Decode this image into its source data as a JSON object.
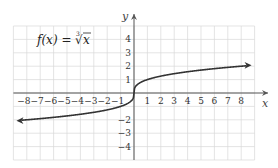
{
  "chart_data": {
    "type": "line",
    "title_parts": {
      "lhs": "f(x)",
      "eq": "=",
      "index": "3",
      "radicand": "x"
    },
    "xlabel": "x",
    "ylabel": "y",
    "xlim": [
      -9,
      9
    ],
    "ylim": [
      -5,
      5
    ],
    "x_ticks": [
      -8,
      -7,
      -6,
      -5,
      -4,
      -3,
      -2,
      -1,
      1,
      2,
      3,
      4,
      5,
      6,
      7,
      8
    ],
    "y_ticks": [
      -4,
      -3,
      -2,
      1,
      2,
      3,
      4
    ],
    "grid": true,
    "legend": null,
    "series": [
      {
        "name": "f(x) = ∛x",
        "function": "cbrt",
        "x": [
          -8.5,
          -8,
          -6,
          -4,
          -2,
          -1,
          -0.5,
          -0.125,
          0,
          0.125,
          0.5,
          1,
          2,
          4,
          6,
          8,
          8.5
        ],
        "y": [
          -2.04,
          -2,
          -1.82,
          -1.59,
          -1.26,
          -1,
          -0.79,
          -0.5,
          0,
          0.5,
          0.79,
          1,
          1.26,
          1.59,
          1.82,
          2,
          2.04
        ],
        "arrows": "both"
      }
    ]
  },
  "colors": {
    "grid": "#d9d9d9",
    "axis": "#555555",
    "curve": "#333333",
    "text": "#333333"
  }
}
